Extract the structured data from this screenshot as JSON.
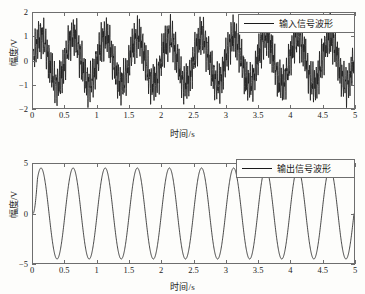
{
  "figure": {
    "background": "#fdfdfb",
    "line_color": "#1a1a1a",
    "frame_color": "#6e6e6e"
  },
  "chart_data": [
    {
      "id": "input-waveform",
      "type": "line",
      "title": "",
      "xlabel": "时间/s",
      "ylabel": "幅度/V",
      "legend": [
        "输入信号波形"
      ],
      "legend_position": "upper right",
      "grid": false,
      "xlim": [
        0,
        5
      ],
      "ylim": [
        -2,
        2
      ],
      "xticks": [
        0,
        0.5,
        1,
        1.5,
        2,
        2.5,
        3,
        3.5,
        4,
        4.5,
        5
      ],
      "xticklabels": [
        "0",
        "0.5",
        "1",
        "1.5",
        "2",
        "2.5",
        "3",
        "3.5",
        "4",
        "4.5",
        "5"
      ],
      "yticks": [
        -2,
        -1,
        0,
        1,
        2
      ],
      "yticklabels": [
        "-2",
        "-1",
        "0",
        "1",
        "2"
      ],
      "description": "2 Hz sine carrier of amplitude 1 V with superimposed high-frequency noise of about 1 V peak",
      "components": [
        {
          "name": "signal",
          "waveform": "sine",
          "amplitude": 1.0,
          "frequency_hz": 2.0,
          "phase": 0
        },
        {
          "name": "noise",
          "waveform": "high-frequency",
          "amplitude": 1.0,
          "frequency_hz": 37.0,
          "phase": 0
        }
      ],
      "samples": 2400
    },
    {
      "id": "output-waveform",
      "type": "line",
      "title": "",
      "xlabel": "时间/s",
      "ylabel": "幅度/V",
      "legend": [
        "输出信号波形"
      ],
      "legend_position": "upper right",
      "grid": false,
      "xlim": [
        0,
        5
      ],
      "ylim": [
        -5,
        5
      ],
      "xticks": [
        0,
        0.5,
        1,
        1.5,
        2,
        2.5,
        3,
        3.5,
        4,
        4.5,
        5
      ],
      "xticklabels": [
        "0",
        "0.5",
        "1",
        "1.5",
        "2",
        "2.5",
        "3",
        "3.5",
        "4",
        "4.5",
        "5"
      ],
      "yticks": [
        -5,
        0,
        5
      ],
      "yticklabels": [
        "-5",
        "0",
        "5"
      ],
      "description": "Filtered clean 2 Hz sine of amplitude about 4.6 V with a short startup transient near t = 0",
      "components": [
        {
          "name": "signal",
          "waveform": "sine",
          "amplitude": 4.6,
          "frequency_hz": 2.0,
          "phase": 0
        }
      ],
      "transient": {
        "start": 0,
        "end": 0.07,
        "note": "initial rise from 0"
      },
      "samples": 1600
    }
  ]
}
